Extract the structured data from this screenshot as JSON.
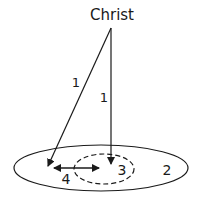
{
  "diagram": {
    "title": "Christ",
    "labels": {
      "path_left": "1",
      "path_vertical": "1",
      "outer_region": "2",
      "inner_region": "3",
      "horizontal_relation": "4"
    },
    "colors": {
      "stroke": "#1a1a1a",
      "background": "#ffffff"
    }
  }
}
